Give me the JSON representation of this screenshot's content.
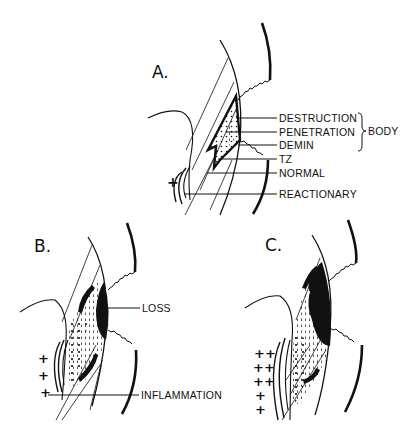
{
  "figure": {
    "panels": [
      {
        "id": "A",
        "label": "A.",
        "annotations": [
          {
            "text": "DESTRUCTION"
          },
          {
            "text": "PENETRATION"
          },
          {
            "text": "DEMIN"
          },
          {
            "text": "TZ"
          },
          {
            "text": "NORMAL"
          },
          {
            "text": "REACTIONARY"
          }
        ],
        "bracket_label": "BODY",
        "bracket_groups": [
          "DESTRUCTION",
          "PENETRATION",
          "DEMIN"
        ],
        "inflammation_marks": "+"
      },
      {
        "id": "B",
        "label": "B.",
        "annotations": [
          {
            "text": "LOSS"
          },
          {
            "text": "INFLAMMATION"
          }
        ],
        "inflammation_marks": [
          "+",
          "+",
          "+"
        ]
      },
      {
        "id": "C",
        "label": "C.",
        "annotations": [],
        "inflammation_marks": [
          "++",
          "++",
          "++",
          "+",
          "+"
        ]
      }
    ]
  }
}
